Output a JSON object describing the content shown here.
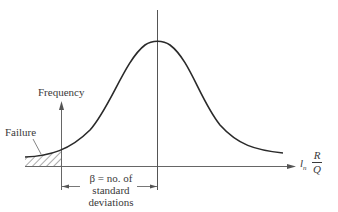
{
  "diagram": {
    "type": "normal-distribution-reliability",
    "labels": {
      "y_axis": "Frequency",
      "failure": "Failure",
      "beta_line1": "β = no. of",
      "beta_line2": "standard",
      "beta_line3": "deviations",
      "x_axis_prefix": "l",
      "x_axis_sub": "n",
      "x_axis_num": "R",
      "x_axis_den": "Q"
    },
    "colors": {
      "curve": "#2a2a2a",
      "axis": "#555555",
      "text": "#3a3a3a"
    }
  }
}
